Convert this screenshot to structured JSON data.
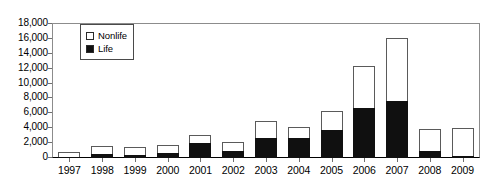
{
  "chart_data": {
    "type": "bar",
    "subtype": "stacked-bar",
    "title": "",
    "xlabel": "",
    "ylabel": "",
    "ylim": [
      0,
      18000
    ],
    "ytick_step": 2000,
    "ytick_labels": [
      "18,000",
      "16,000",
      "14,000",
      "12,000",
      "10,000",
      "8,000",
      "6,000",
      "4,000",
      "2,000",
      "0"
    ],
    "ytick_values": [
      18000,
      16000,
      14000,
      12000,
      10000,
      8000,
      6000,
      4000,
      2000,
      0
    ],
    "grid": false,
    "legend_position": "top-left-inside",
    "categories": [
      "1997",
      "1998",
      "1999",
      "2000",
      "2001",
      "2002",
      "2003",
      "2004",
      "2005",
      "2006",
      "2007",
      "2008",
      "2009"
    ],
    "series": [
      {
        "name": "Life",
        "color": "#101010",
        "values": [
          200,
          500,
          400,
          650,
          2000,
          900,
          2650,
          2650,
          3800,
          6700,
          7700,
          950,
          300
        ]
      },
      {
        "name": "Nonlife",
        "color": "#ffffff",
        "values": [
          600,
          1100,
          1100,
          1100,
          1050,
          1250,
          2350,
          1550,
          2450,
          5700,
          8400,
          2950,
          3700
        ]
      }
    ],
    "totals": [
      800,
      1600,
      1500,
      1750,
      3050,
      2150,
      5000,
      4200,
      6250,
      12400,
      16100,
      3900,
      4000
    ]
  },
  "legend": {
    "entries": [
      {
        "label": "Nonlife",
        "swatch": "white-square"
      },
      {
        "label": "Life",
        "swatch": "black-square"
      }
    ]
  }
}
